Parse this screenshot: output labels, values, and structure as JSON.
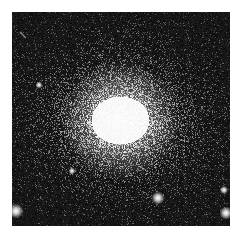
{
  "image": {
    "subject": "globular star cluster",
    "background_color": "#0a0a0a",
    "frame_color": "#ffffff",
    "core": {
      "cx": 108,
      "cy": 108,
      "rx": 34,
      "ry": 28,
      "color": "#f4f4f4"
    },
    "halo": {
      "radius": 95
    },
    "bright_stars": [
      {
        "x": 4,
        "y": 199,
        "r": 2.5
      },
      {
        "x": 146,
        "y": 186,
        "r": 2.2
      },
      {
        "x": 214,
        "y": 201,
        "r": 2.2
      },
      {
        "x": 212,
        "y": 178,
        "r": 1.4
      },
      {
        "x": 27,
        "y": 73,
        "r": 1.2
      },
      {
        "x": 60,
        "y": 159,
        "r": 1.2
      }
    ],
    "streak": {
      "x1": 8,
      "y1": 20,
      "x2": 14,
      "y2": 26
    }
  }
}
